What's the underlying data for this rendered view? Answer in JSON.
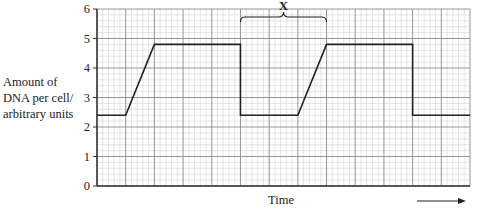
{
  "chart_data": {
    "type": "line",
    "title": "",
    "xlabel": "Time",
    "ylabel": "Amount of DNA per cell/ arbitrary units",
    "ylabel_lines": [
      "Amount of",
      "DNA per cell/",
      "arbitrary units"
    ],
    "ylim": [
      0,
      6
    ],
    "yticks": [
      0,
      1,
      2,
      3,
      4,
      5,
      6
    ],
    "x_grid_columns": 13,
    "minor_per_major": 5,
    "grid": true,
    "x_axis_arrow": true,
    "annotation": {
      "label": "X",
      "type": "brace",
      "x_start": 5,
      "x_end": 8
    },
    "series": [
      {
        "name": "DNA per cell",
        "points": [
          [
            0,
            2.4
          ],
          [
            1,
            2.4
          ],
          [
            2,
            4.8
          ],
          [
            5,
            4.8
          ],
          [
            5,
            2.4
          ],
          [
            7,
            2.4
          ],
          [
            8,
            4.8
          ],
          [
            11,
            4.8
          ],
          [
            11,
            2.4
          ],
          [
            13,
            2.4
          ]
        ]
      }
    ]
  },
  "colors": {
    "minor_grid": "#d4d4d4",
    "major_grid": "#8a8a8a",
    "axis": "#333333",
    "line": "#222222"
  }
}
